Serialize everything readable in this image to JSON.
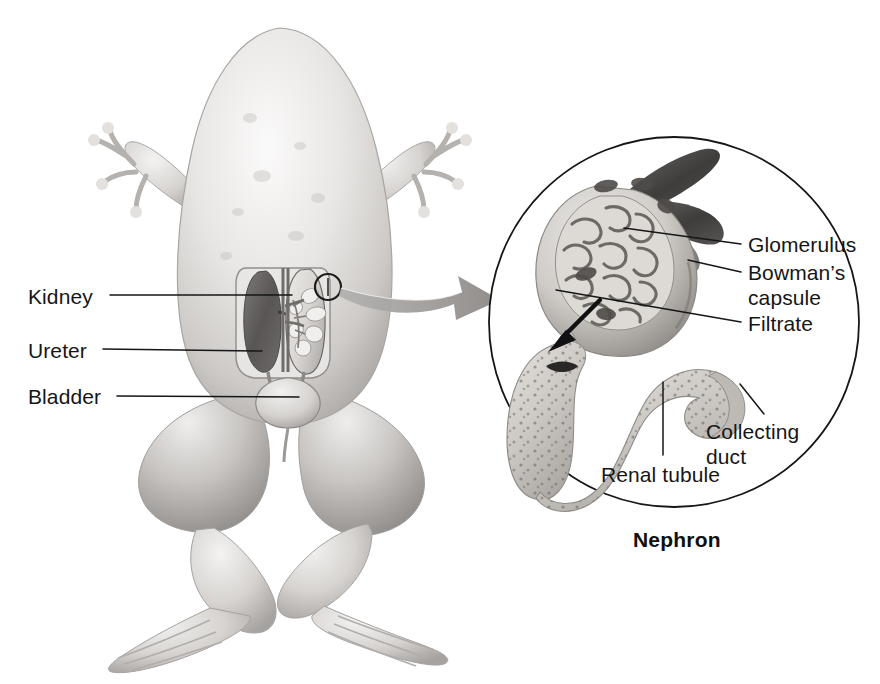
{
  "figure": {
    "background_color": "#ffffff",
    "line_color": "#161616",
    "caption": "Nephron"
  },
  "organism_labels": [
    {
      "id": "kidney",
      "text": "Kidney",
      "x": 28,
      "y": 284,
      "leader": {
        "x1": 110,
        "y1": 295,
        "x2": 292,
        "y2": 295
      }
    },
    {
      "id": "ureter",
      "text": "Ureter",
      "x": 28,
      "y": 338,
      "leader": {
        "x1": 103,
        "y1": 349,
        "x2": 258,
        "y2": 349
      }
    },
    {
      "id": "bladder",
      "text": "Bladder",
      "x": 28,
      "y": 384,
      "leader": {
        "x1": 117,
        "y1": 396,
        "x2": 299,
        "y2": 396
      }
    }
  ],
  "nephron_labels": [
    {
      "id": "glomerulus",
      "text": "Glomerulus",
      "x": 748,
      "y": 233,
      "lines": 1,
      "leader": {
        "x1": 740,
        "y1": 244,
        "x2": 645,
        "y2": 238
      }
    },
    {
      "id": "bowmans-capsule",
      "text": "Bowman’s capsule",
      "x": 748,
      "y": 261,
      "lines": 2,
      "leader": {
        "x1": 740,
        "y1": 272,
        "x2": 690,
        "y2": 262
      }
    },
    {
      "id": "filtrate",
      "text": "Filtrate",
      "x": 748,
      "y": 312,
      "lines": 1,
      "leader": {
        "x1": 740,
        "y1": 322,
        "x2": 562,
        "y2": 296
      }
    },
    {
      "id": "collecting-duct",
      "text": "Collecting duct",
      "x": 706,
      "y": 420,
      "lines": 2,
      "leader": {
        "x1": 760,
        "y1": 418,
        "x2": 745,
        "y2": 390
      }
    },
    {
      "id": "renal-tubule",
      "text": "Renal tubule",
      "x": 601,
      "y": 463,
      "lines": 1,
      "leader": {
        "x1": 663,
        "y1": 459,
        "x2": 663,
        "y2": 380
      }
    }
  ],
  "inset": {
    "circle": {
      "cx": 674,
      "cy": 322,
      "r": 185
    },
    "caption": "Nephron",
    "caption_x": 633,
    "caption_y": 529
  },
  "magnifier": {
    "source_marker": {
      "cx": 328,
      "cy": 287,
      "r": 13
    },
    "arrow_color": "#9a9a9a"
  },
  "colors": {
    "outline": "#161616",
    "body_light": "#f0efee",
    "body_mid": "#c9c7c5",
    "body_shadow": "#9b9896",
    "kidney_dark": "#5f5d5c",
    "tubule": "#c8c5c1",
    "tubule_dot": "#6f6c69",
    "arteriole": "#4a4847",
    "arrow_gray": "#9a9a9a"
  }
}
